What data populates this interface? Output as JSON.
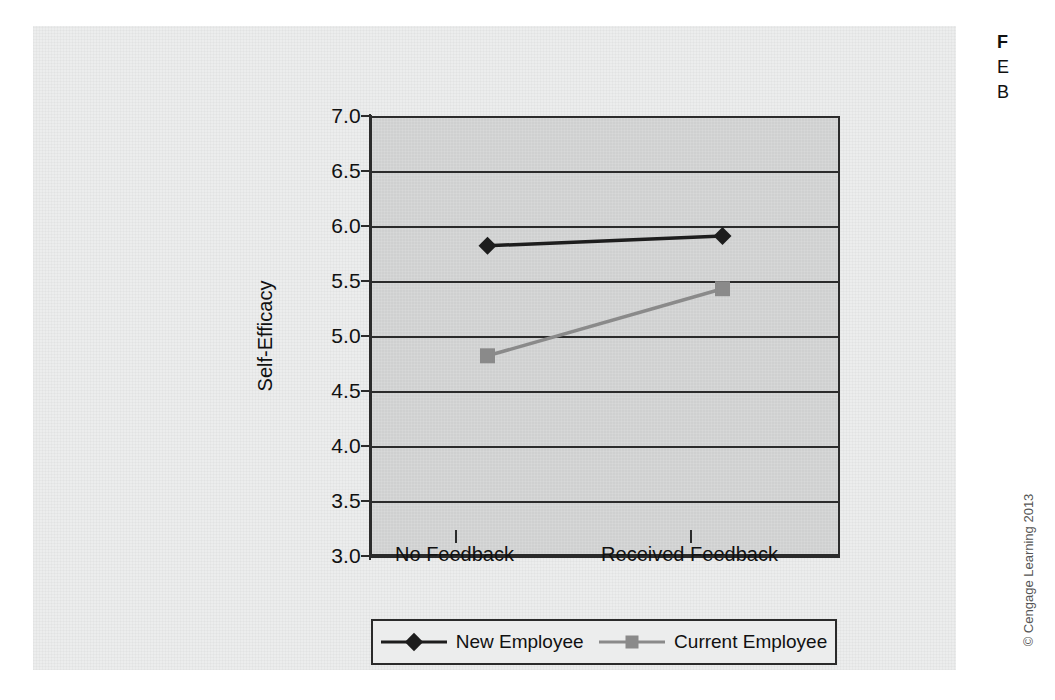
{
  "chart_data": {
    "type": "line",
    "title": "",
    "xlabel": "",
    "ylabel": "Self-Efficacy",
    "categories": [
      "No Feedback",
      "Received Feedback"
    ],
    "ylim": [
      3.0,
      7.0
    ],
    "yticks": [
      "3.0",
      "3.5",
      "4.0",
      "4.5",
      "5.0",
      "5.5",
      "6.0",
      "6.5",
      "7.0"
    ],
    "ytick_values": [
      3.0,
      3.5,
      4.0,
      4.5,
      5.0,
      5.5,
      6.0,
      6.5,
      7.0
    ],
    "grid": true,
    "legend_position": "bottom",
    "series": [
      {
        "name": "New Employee",
        "values": [
          5.82,
          5.91
        ],
        "color": "#1d1d1d",
        "marker": "diamond"
      },
      {
        "name": "Current Employee",
        "values": [
          4.82,
          5.43
        ],
        "color": "#8a8a8a",
        "marker": "square"
      }
    ]
  },
  "figure": {
    "plot_background": "#cfd0d0",
    "panel_background": "#eceded",
    "axis_color": "#2b2b2b"
  },
  "caption": {
    "line1": "F",
    "line2": "E",
    "line3": "B"
  },
  "credit": {
    "text": "© Cengage Learning 2013"
  }
}
